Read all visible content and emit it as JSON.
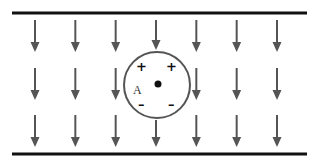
{
  "diagram": {
    "title": "",
    "field_direction": "down",
    "plates": [
      {
        "name": "top-plate"
      },
      {
        "name": "bottom-plate"
      }
    ],
    "field": {
      "columns": 7,
      "rows": 3,
      "arrow_color": "#555555"
    },
    "sphere": {
      "label": "A",
      "center_marker": "dot",
      "top_charges": [
        "+",
        "+"
      ],
      "bottom_charges": [
        "-",
        "-"
      ]
    },
    "colors": {
      "plate": "#111111",
      "arrow": "#555555",
      "outline": "#555555"
    }
  }
}
